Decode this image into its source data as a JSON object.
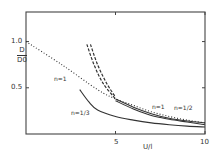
{
  "chart_data": {
    "type": "line",
    "title": "",
    "xlabel": "U/l",
    "ylabel": "D/D0",
    "ylabel_num": "D",
    "ylabel_den": "D0",
    "xlim": [
      0,
      10
    ],
    "ylim": [
      0,
      1.32
    ],
    "grid": false,
    "legend": "inline annotations",
    "x_ticks": [
      {
        "value": 5,
        "label": "5"
      },
      {
        "value": 10,
        "label": "10"
      }
    ],
    "y_ticks": [
      {
        "value": 0.5,
        "label": "0.5"
      },
      {
        "value": 1.0,
        "label": "1.0"
      }
    ],
    "series": [
      {
        "name": "n=1 (dotted)",
        "style": "dotted",
        "points": [
          [
            0,
            1.0
          ],
          [
            2,
            0.75
          ],
          [
            4,
            0.48
          ],
          [
            5,
            0.38
          ],
          [
            6,
            0.31
          ],
          [
            7,
            0.24
          ],
          [
            8,
            0.19
          ],
          [
            9,
            0.15
          ],
          [
            10,
            0.12
          ]
        ]
      },
      {
        "name": "n=1 (dashed, outer)",
        "style": "dashed",
        "points": [
          [
            3.6,
            0.97
          ],
          [
            4.0,
            0.75
          ],
          [
            4.5,
            0.55
          ],
          [
            5.0,
            0.4
          ]
        ]
      },
      {
        "name": "n=1/2 (dashed, inner)",
        "style": "dashed",
        "points": [
          [
            3.4,
            0.97
          ],
          [
            3.8,
            0.75
          ],
          [
            4.3,
            0.55
          ],
          [
            5.0,
            0.38
          ]
        ]
      },
      {
        "name": "n=1",
        "style": "solid",
        "points": [
          [
            5.0,
            0.38
          ],
          [
            6,
            0.29
          ],
          [
            7,
            0.22
          ],
          [
            8,
            0.17
          ],
          [
            9,
            0.14
          ],
          [
            10,
            0.12
          ]
        ]
      },
      {
        "name": "n=1/2",
        "style": "solid",
        "points": [
          [
            5.0,
            0.36
          ],
          [
            6,
            0.27
          ],
          [
            7,
            0.2
          ],
          [
            8,
            0.16
          ],
          [
            9,
            0.13
          ],
          [
            10,
            0.1
          ]
        ]
      },
      {
        "name": "n=1/3",
        "style": "solid",
        "points": [
          [
            3.0,
            0.48
          ],
          [
            3.5,
            0.35
          ],
          [
            4,
            0.26
          ],
          [
            5,
            0.19
          ],
          [
            6,
            0.15
          ],
          [
            7,
            0.12
          ],
          [
            8,
            0.1
          ],
          [
            9,
            0.085
          ],
          [
            10,
            0.075
          ]
        ]
      }
    ],
    "annotations": [
      {
        "text": "n=1",
        "x": 2.2,
        "y": 0.55
      },
      {
        "text": "n=1/3",
        "x": 2.1,
        "y": 0.25
      },
      {
        "text": "n=1",
        "x": 8.2,
        "y": 0.27
      },
      {
        "text": "n=1/2",
        "x": 9.0,
        "y": 0.26
      }
    ]
  }
}
